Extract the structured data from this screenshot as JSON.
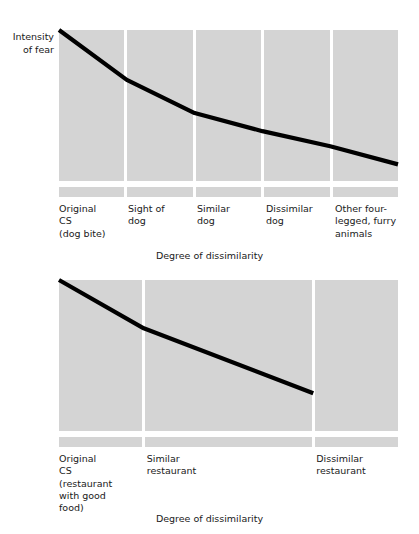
{
  "figure": {
    "background_color": "#ffffff",
    "band_color": "#d4d4d4",
    "line_color": "#000000",
    "divider_color": "#ffffff"
  },
  "chart_data": [
    {
      "id": "fear-gradient",
      "type": "line",
      "title": "",
      "ylabel": "Intensity\nof fear",
      "xlabel": "Degree of dissimilarity",
      "grid": false,
      "legend": null,
      "band_count": 5,
      "band_weights": [
        1,
        1,
        1,
        1,
        1
      ],
      "categories": [
        "Original\nCS\n(dog bite)",
        "Sight of\ndog",
        "Similar\ndog",
        "Dissimilar\ndog",
        "Other four-\nlegged, furry\nanimals"
      ],
      "x": [
        0,
        1,
        2,
        3,
        4,
        5
      ],
      "values": [
        100,
        67,
        45,
        33,
        23,
        11
      ],
      "xlim": [
        0,
        5
      ],
      "ylim": [
        0,
        100
      ]
    },
    {
      "id": "taste-aversion-gradient",
      "type": "line",
      "title": "",
      "ylabel": "",
      "xlabel": "Degree of dissimilarity",
      "grid": false,
      "legend": null,
      "band_count": 3,
      "band_weights": [
        1,
        2,
        1
      ],
      "categories": [
        "Original\nCS\n(restaurant\nwith good\nfood)",
        "Similar\nrestaurant",
        "Dissimilar\nrestaurant"
      ],
      "x": [
        0,
        1,
        3
      ],
      "values": [
        100,
        68,
        25
      ],
      "xlim": [
        0,
        4
      ],
      "ylim": [
        0,
        100
      ]
    }
  ],
  "charts": {
    "fear": {
      "ylabel": "Intensity\nof fear",
      "xaxis_title": "Degree of dissimilarity",
      "ticks": [
        "Original\nCS\n(dog bite)",
        "Sight of\ndog",
        "Similar\ndog",
        "Dissimilar\ndog",
        "Other four-\nlegged, furry\nanimals"
      ]
    },
    "taste": {
      "ylabel": "",
      "xaxis_title": "Degree of dissimilarity",
      "ticks": [
        "Original\nCS\n(restaurant\nwith good\nfood)",
        "Similar\nrestaurant",
        "Dissimilar\nrestaurant"
      ]
    }
  }
}
